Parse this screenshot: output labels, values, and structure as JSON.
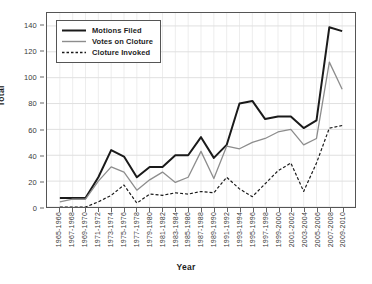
{
  "chart_data": {
    "type": "line",
    "title": "",
    "xlabel": "Year",
    "ylabel": "Total",
    "ylim": [
      0,
      150
    ],
    "yticks": [
      0,
      20,
      40,
      60,
      80,
      100,
      120,
      140
    ],
    "grid": true,
    "legend_position": "top-left",
    "categories": [
      "1965-1966",
      "1967-1968",
      "1969-1970",
      "1971-1972",
      "1973-1974",
      "1975-1976",
      "1977-1978",
      "1979-1980",
      "1981-1982",
      "1983-1984",
      "1985-1986",
      "1987-1988",
      "1989-1990",
      "1991-1992",
      "1993-1994",
      "1995-1996",
      "1997-1998",
      "1999-2000",
      "2001-2002",
      "2003-2004",
      "2005-2006",
      "2007-2008",
      "2009-2010"
    ],
    "series": [
      {
        "name": "Motions Filed",
        "style": "solid-thick",
        "color": "#1a1a1a",
        "values": [
          7,
          7,
          7,
          23,
          44,
          39,
          23,
          31,
          31,
          40,
          40,
          54,
          38,
          48,
          80,
          82,
          68,
          70,
          70,
          61,
          67,
          139,
          136
        ]
      },
      {
        "name": "Votes on Cloture",
        "style": "solid-thin",
        "color": "#8d8d8d",
        "values": [
          4,
          6,
          6,
          20,
          31,
          27,
          13,
          21,
          27,
          19,
          23,
          43,
          22,
          47,
          45,
          50,
          53,
          58,
          60,
          48,
          53,
          112,
          91
        ]
      },
      {
        "name": "Cloture Invoked",
        "style": "dotted",
        "color": "#1a1a1a",
        "values": [
          0,
          0,
          0,
          4,
          9,
          17,
          3,
          10,
          9,
          11,
          10,
          12,
          11,
          23,
          14,
          8,
          18,
          28,
          34,
          12,
          34,
          61,
          63
        ]
      }
    ]
  }
}
